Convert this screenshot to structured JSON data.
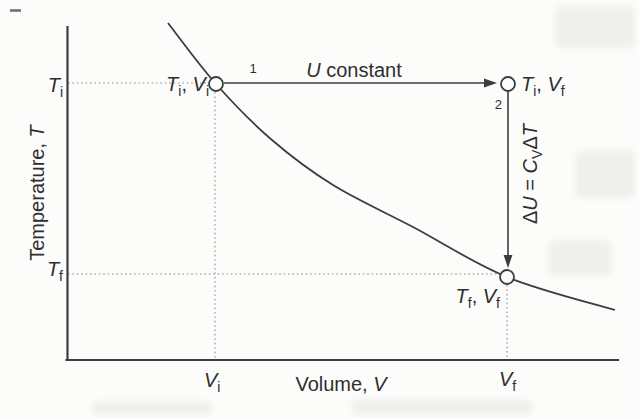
{
  "colors": {
    "ink": "#3d3d3d",
    "text": "#2e2e2e",
    "dotted": "#8f8f8f",
    "paper": "#fcfcfb"
  },
  "labels": {
    "y_axis": {
      "name": "Temperature, ",
      "symbol": "T"
    },
    "x_axis": {
      "name": "Volume, ",
      "symbol": "V"
    },
    "tick_ti": {
      "symbol": "T",
      "sub": "i"
    },
    "tick_tf": {
      "symbol": "T",
      "sub": "f"
    },
    "tick_vi": {
      "symbol": "V",
      "sub": "i"
    },
    "tick_vf": {
      "symbol": "V",
      "sub": "f"
    },
    "point_initial": {
      "t": "T",
      "tsub": "i",
      "comma": ", ",
      "v": "V",
      "vsub": "i"
    },
    "point_constU": {
      "t": "T",
      "tsub": "i",
      "comma": ", ",
      "v": "V",
      "vsub": "f"
    },
    "point_final": {
      "t": "T",
      "tsub": "f",
      "comma": ", ",
      "v": "V",
      "vsub": "f"
    },
    "step1": "1",
    "step2": "2",
    "path1": {
      "symbol": "U",
      "rest": " constant"
    },
    "path2": {
      "delta1": "Δ",
      "u": "U",
      "equals": " = ",
      "c": "C",
      "csub": "V",
      "delta2": "Δ",
      "t": "T"
    }
  },
  "geometry": {
    "curve_points": [
      [
        168,
        23
      ],
      [
        216,
        84
      ],
      [
        272,
        140
      ],
      [
        333,
        185
      ],
      [
        413,
        227
      ],
      [
        507,
        277
      ],
      [
        615,
        310
      ]
    ]
  }
}
